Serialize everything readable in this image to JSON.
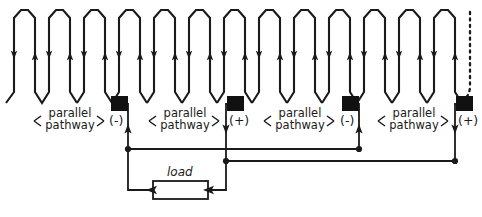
{
  "diagram": {
    "type": "circuit-schematic",
    "stroke_color": "#1a1a1a",
    "background_color": "#ffffff"
  },
  "labels": {
    "parallel_pathway_line1": "parallel",
    "parallel_pathway_line2": "pathway",
    "left_arrow": "⟨",
    "right_arrow": "⟩",
    "load": "load",
    "negative_terminal": "(-)",
    "positive_terminal": "(+)"
  },
  "pathways": [
    {
      "index": 1,
      "label_line1": "parallel",
      "label_line2": "pathway",
      "x": 68,
      "y": 117
    },
    {
      "index": 2,
      "label_line1": "parallel",
      "label_line2": "pathway",
      "x": 183,
      "y": 117
    },
    {
      "index": 3,
      "label_line1": "parallel",
      "label_line2": "pathway",
      "x": 298,
      "y": 117
    },
    {
      "index": 4,
      "label_line1": "parallel",
      "label_line2": "pathway",
      "x": 412,
      "y": 117
    }
  ],
  "electrodes": [
    {
      "index": 1,
      "polarity": "(-)",
      "x": 119,
      "y": 104
    },
    {
      "index": 2,
      "polarity": "(+)",
      "x": 235,
      "y": 104
    },
    {
      "index": 3,
      "polarity": "(-)",
      "x": 350,
      "y": 104
    },
    {
      "index": 4,
      "polarity": "(+)",
      "x": 464,
      "y": 104
    }
  ],
  "serpentine": {
    "folds": 13,
    "pitch": 34,
    "top_y": 10,
    "bottom_y": 103,
    "arrow_directions": [
      "down",
      "up",
      "down",
      "up",
      "down",
      "up",
      "down",
      "up",
      "down",
      "up",
      "down",
      "up",
      "down"
    ],
    "continuation_marker": "dashed"
  },
  "buses": {
    "negative_bus_y": 149,
    "positive_bus_y": 161
  },
  "load_element": {
    "label": "load",
    "x": 153,
    "y": 190,
    "width": 55,
    "height": 18,
    "current_arrows": 2
  }
}
